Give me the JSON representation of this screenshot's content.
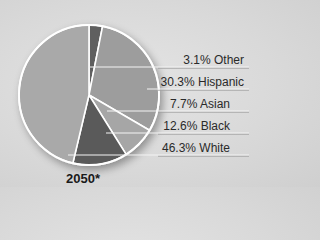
{
  "chart_data": {
    "type": "pie",
    "title": "2050*",
    "categories": [
      "Other",
      "Hispanic",
      "Asian",
      "Black",
      "White"
    ],
    "values": [
      3.1,
      30.3,
      7.7,
      12.6,
      46.3
    ],
    "labels": [
      "3.1% Other",
      "30.3% Hispanic",
      "7.7% Asian",
      "12.6% Black",
      "46.3% White"
    ],
    "colors": [
      "#5e5e5e",
      "#9d9d9d",
      "#a6a6a6",
      "#5a5a5a",
      "#a9a9a9"
    ],
    "start_angle_deg": 0,
    "direction": "clockwise",
    "legend_position": "right",
    "unit": "%"
  },
  "caption": "2050*",
  "labels": {
    "other": "3.1% Other",
    "hispanic": "30.3% Hispanic",
    "asian": "7.7% Asian",
    "black": "12.6% Black",
    "white": "46.3% White"
  }
}
